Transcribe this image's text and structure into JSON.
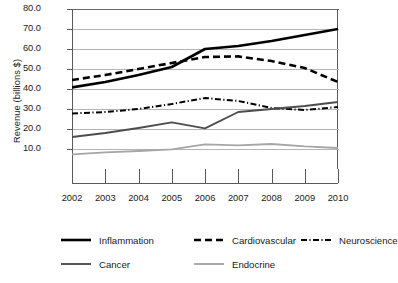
{
  "chart_data": {
    "type": "line",
    "title": "",
    "xlabel": "",
    "ylabel": "Revenue (billions $)",
    "categories": [
      "2002",
      "2003",
      "2004",
      "2005",
      "2006",
      "2007",
      "2008",
      "2009",
      "2010"
    ],
    "x": [
      2002,
      2003,
      2004,
      2005,
      2006,
      2007,
      2008,
      2009,
      2010
    ],
    "ylim": [
      0,
      80
    ],
    "yticks": [
      10.0,
      20.0,
      30.0,
      40.0,
      50.0,
      60.0,
      70.0,
      80.0
    ],
    "ytick_labels": [
      "10.0",
      "20.0",
      "30.0",
      "40.0",
      "50.0",
      "60.0",
      "70.0",
      "80.0"
    ],
    "grid": true,
    "legend_position": "bottom",
    "series": [
      {
        "name": "Inflammation",
        "style": "solid",
        "color": "#000000",
        "width": 2.6,
        "values": [
          40.8,
          43.5,
          47.0,
          51.0,
          60.0,
          61.5,
          64.0,
          67.0,
          70.0
        ]
      },
      {
        "name": "Cardiovascular",
        "style": "dashed",
        "color": "#000000",
        "width": 2.6,
        "values": [
          44.5,
          47.0,
          50.0,
          53.0,
          56.0,
          56.3,
          54.0,
          50.5,
          43.5
        ]
      },
      {
        "name": "Neuroscience",
        "style": "dash-dot",
        "color": "#000000",
        "width": 2.0,
        "values": [
          27.8,
          28.5,
          30.0,
          32.5,
          35.5,
          34.0,
          30.5,
          29.5,
          31.0
        ]
      },
      {
        "name": "Cancer",
        "style": "solid",
        "color": "#4d4d4d",
        "width": 1.9,
        "values": [
          16.0,
          18.0,
          20.5,
          23.3,
          20.3,
          28.5,
          30.0,
          31.5,
          33.5
        ]
      },
      {
        "name": "Endocrine",
        "style": "solid",
        "color": "#a6a6a6",
        "width": 1.9,
        "values": [
          7.3,
          8.3,
          9.0,
          9.8,
          12.3,
          11.8,
          12.5,
          11.3,
          10.5
        ]
      }
    ]
  },
  "axis": {
    "y_title": "Revenue (billions $)"
  },
  "legend": {
    "items": [
      {
        "label": "Inflammation",
        "icon": "solid-line-swatch"
      },
      {
        "label": "Cardiovascular",
        "icon": "dashed-line-swatch"
      },
      {
        "label": "Neuroscience",
        "icon": "dash-dot-line-swatch"
      },
      {
        "label": "Cancer",
        "icon": "solid-line-swatch"
      },
      {
        "label": "Endocrine",
        "icon": "solid-line-swatch"
      }
    ]
  }
}
